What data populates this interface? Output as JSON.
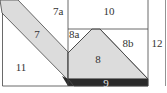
{
  "diagram": {
    "type": "quilt-block-piecing-diagram",
    "colors": {
      "background": "#ffffff",
      "line": "#444444",
      "light_fill": "#dcdcdc",
      "dark_fill": "#2a2a2a"
    },
    "pieces": [
      {
        "id": "7",
        "label": "7",
        "fill": "light"
      },
      {
        "id": "7a",
        "label": "7a",
        "fill": "white"
      },
      {
        "id": "8",
        "label": "8",
        "fill": "light"
      },
      {
        "id": "8a",
        "label": "8a",
        "fill": "white"
      },
      {
        "id": "8b",
        "label": "8b",
        "fill": "white"
      },
      {
        "id": "9",
        "label": "9",
        "fill": "dark"
      },
      {
        "id": "10",
        "label": "10",
        "fill": "white"
      },
      {
        "id": "11",
        "label": "11",
        "fill": "white"
      },
      {
        "id": "12",
        "label": "12",
        "fill": "white"
      }
    ]
  }
}
